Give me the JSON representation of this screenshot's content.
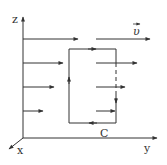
{
  "diagram": {
    "axes": {
      "z_label": "z",
      "y_label": "y",
      "x_label": "x"
    },
    "velocity_label": "υ",
    "loop_label": "C",
    "field_rows": [
      {
        "z": 39,
        "left_end": 78,
        "right_start": 96,
        "right_end": 150
      },
      {
        "z": 63,
        "left_end": 63,
        "right_start": 96,
        "right_end": 137
      },
      {
        "z": 87,
        "left_end": 54,
        "right_start": 96,
        "right_end": 125
      },
      {
        "z": 111,
        "left_end": 43,
        "right_start": 96,
        "right_end": 115
      }
    ],
    "loop": {
      "left": 69,
      "right": 116,
      "top": 49,
      "bottom": 123,
      "direction": "counterclockwise as drawn (up left side, right along top, down right side, left along bottom)"
    },
    "colors": {
      "line": "#333333"
    }
  }
}
